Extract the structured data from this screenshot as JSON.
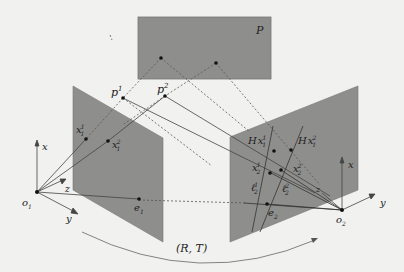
{
  "figure": {
    "plane_label": "P",
    "points_3d": [
      "p1",
      "p2"
    ],
    "p1_label": "p",
    "p1_sup": "1",
    "p2_label": "p",
    "p2_sup": "2",
    "left_camera": {
      "center": "o",
      "center_sub": "1",
      "axes": {
        "x": "x",
        "y": "y",
        "z": "z"
      },
      "image_points": [
        {
          "base": "x",
          "sup": "1",
          "sub": "1"
        },
        {
          "base": "x",
          "sup": "2",
          "sub": "1"
        }
      ],
      "epipole": {
        "base": "e",
        "sub": "1"
      }
    },
    "right_camera": {
      "center": "o",
      "center_sub": "2",
      "axes": {
        "x": "x",
        "y": "y",
        "z": "z"
      },
      "image_points": [
        {
          "base": "x",
          "sup": "1",
          "sub": "2"
        },
        {
          "base": "x",
          "sup": "2",
          "sub": "2"
        }
      ],
      "homography_points": [
        {
          "prefix": "H",
          "base": "x",
          "sup": "1",
          "sub": "1"
        },
        {
          "prefix": "H",
          "base": "x",
          "sup": "2",
          "sub": "1"
        }
      ],
      "epipolar_lines": [
        {
          "base": "ℓ",
          "sup": "1",
          "sub": "2"
        },
        {
          "base": "ℓ",
          "sup": "2",
          "sub": "2"
        }
      ],
      "epipole": {
        "base": "e",
        "sub": "2"
      }
    },
    "motion_label": "(R, T)"
  },
  "colors": {
    "plane_fill": "#8e8e8c",
    "line": "#555555",
    "dashed": "#666666",
    "background": "#f1f1ef"
  }
}
